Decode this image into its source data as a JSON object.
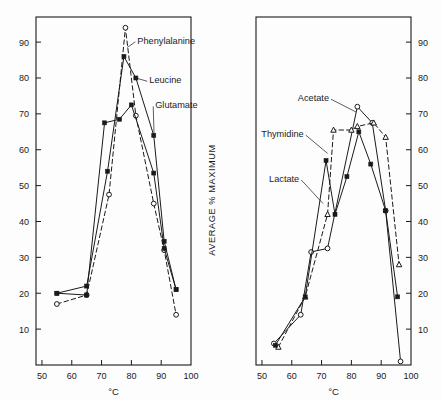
{
  "figure": {
    "background": "#fdfdfd",
    "ink": "#1a1a1a",
    "xlabel": "°C",
    "ylabel": "AVERAGE % MAXIMUM"
  },
  "axis": {
    "y_ticks": [
      10,
      20,
      30,
      40,
      50,
      60,
      70,
      80,
      90
    ],
    "y_tick_labels": [
      "10",
      "20",
      "30",
      "40",
      "50",
      "60",
      "70",
      "80",
      "90"
    ],
    "x_ticks": [
      50,
      60,
      70,
      80,
      90,
      100
    ],
    "x_tick_labels": [
      "50",
      "60",
      "70",
      "80",
      "90",
      "100"
    ],
    "xlim": [
      48,
      100
    ],
    "ylim": [
      0,
      97
    ]
  },
  "chart_data": [
    {
      "type": "line",
      "panel": "left",
      "title": "",
      "xlabel": "°C",
      "ylabel": "AVERAGE % MAXIMUM",
      "xlim": [
        48,
        100
      ],
      "ylim": [
        0,
        97
      ],
      "grid": false,
      "legend": "inline-annotations",
      "series": [
        {
          "name": "Phenylalanine",
          "marker": "open-circle",
          "linestyle": "dashed",
          "x": [
            55,
            65,
            72.5,
            78,
            81.5,
            87.5,
            91,
            95
          ],
          "y": [
            17,
            19.5,
            47.5,
            94,
            69.5,
            45,
            32,
            14
          ]
        },
        {
          "name": "Leucine",
          "marker": "filled-square",
          "linestyle": "solid",
          "x": [
            55,
            65,
            72,
            77.5,
            81.5,
            87.5,
            91,
            95
          ],
          "y": [
            20,
            22,
            54,
            86,
            80,
            64,
            34.5,
            21
          ]
        },
        {
          "name": "Glutamate",
          "marker": "filled-square",
          "linestyle": "solid",
          "x": [
            55,
            65,
            71,
            76,
            80,
            87.5,
            91,
            95
          ],
          "y": [
            20,
            19.5,
            67.5,
            68.5,
            72.5,
            53.5,
            32.5,
            21
          ]
        }
      ],
      "annotations": [
        {
          "label": "Phenylalanine",
          "x": 82,
          "y": 90.5
        },
        {
          "label": "Leucine",
          "x": 86,
          "y": 79.5
        },
        {
          "label": "Glutamate",
          "x": 88,
          "y": 72.5
        }
      ]
    },
    {
      "type": "line",
      "panel": "right",
      "title": "",
      "xlabel": "°C",
      "ylabel": "AVERAGE % MAXIMUM",
      "xlim": [
        48,
        100
      ],
      "ylim": [
        0,
        97
      ],
      "grid": false,
      "legend": "inline-annotations",
      "series": [
        {
          "name": "Acetate",
          "marker": "open-circle",
          "linestyle": "solid",
          "x": [
            54,
            63,
            66.5,
            72,
            82,
            87,
            91.5,
            96.5
          ],
          "y": [
            6,
            14,
            31.5,
            32.5,
            72,
            67.5,
            43,
            1
          ]
        },
        {
          "name": "Thymidine",
          "marker": "open-triangle",
          "linestyle": "dashed",
          "x": [
            55.5,
            64.5,
            72,
            74,
            80,
            82,
            87.5,
            91.5,
            96
          ],
          "y": [
            5,
            19,
            42,
            65.5,
            65.5,
            66.5,
            67.5,
            63.5,
            28
          ]
        },
        {
          "name": "Lactate",
          "marker": "filled-square",
          "linestyle": "solid",
          "x": [
            54.5,
            64.5,
            71.5,
            74.5,
            78.5,
            82.5,
            86.5,
            91.5,
            95.5
          ],
          "y": [
            5.5,
            19,
            57,
            42,
            52.5,
            65,
            56,
            43,
            19
          ]
        }
      ],
      "annotations": [
        {
          "label": "Acetate",
          "x": 72.5,
          "y": 74.5
        },
        {
          "label": "Thymidine",
          "x": 64,
          "y": 64.5
        },
        {
          "label": "Lactate",
          "x": 62.5,
          "y": 52
        }
      ]
    }
  ]
}
